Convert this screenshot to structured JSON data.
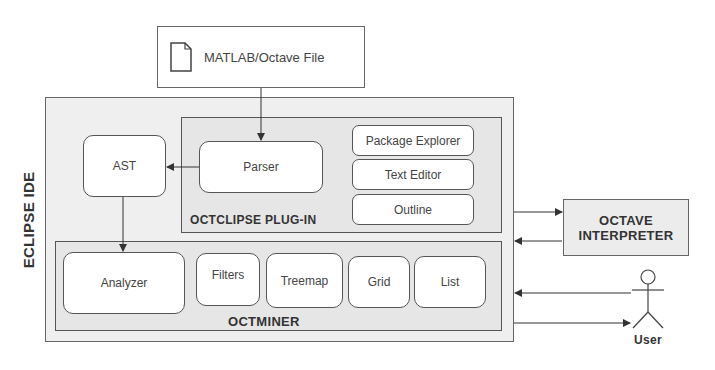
{
  "diagram": {
    "input_file": {
      "label": "MATLAB/Octave File",
      "icon": "document-icon"
    },
    "eclipse_ide": {
      "label": "ECLIPSE IDE"
    },
    "octclipse_plugin": {
      "label": "OCTCLIPSE PLUG-IN",
      "components": [
        "Parser",
        "Package Explorer",
        "Text Editor",
        "Outline"
      ]
    },
    "ast": {
      "label": "AST"
    },
    "octminer": {
      "label": "OCTMINER",
      "components": [
        "Analyzer",
        "Filters",
        "Treemap",
        "Grid",
        "List"
      ]
    },
    "octave_interpreter": {
      "line1": "OCTAVE",
      "line2": "INTERPRETER"
    },
    "user": {
      "label": "User",
      "icon": "stick-figure-icon"
    },
    "connections": [
      {
        "from": "MATLAB/Octave File",
        "to": "Parser"
      },
      {
        "from": "Parser",
        "to": "AST"
      },
      {
        "from": "AST",
        "to": "Analyzer"
      },
      {
        "from": "Eclipse IDE",
        "to": "Octave Interpreter"
      },
      {
        "from": "Octave Interpreter",
        "to": "Eclipse IDE"
      },
      {
        "from": "User",
        "to": "Eclipse IDE"
      },
      {
        "from": "Eclipse IDE",
        "to": "User"
      }
    ]
  }
}
